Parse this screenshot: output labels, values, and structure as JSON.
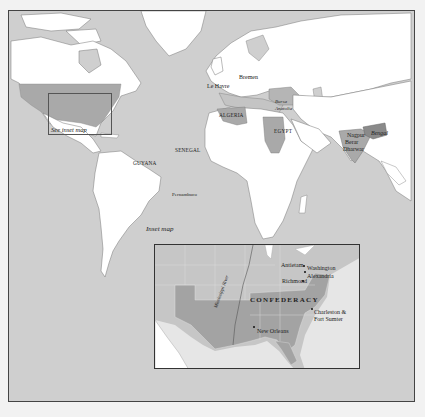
{
  "map": {
    "colors": {
      "ocean": "#cfcfcf",
      "land": "#ffffff",
      "shaded_region": "#a9a9a9",
      "dark_region": "#8a8a8a",
      "frame": "#444444",
      "page": "#f2f2f2"
    },
    "main_labels": [
      {
        "id": "le-havre",
        "text": "Le Havre"
      },
      {
        "id": "bremen",
        "text": "Bremen"
      },
      {
        "id": "bursa",
        "text": "Bursa"
      },
      {
        "id": "anatolia",
        "text": "Anatolia"
      },
      {
        "id": "algeria",
        "text": "ALGERIA"
      },
      {
        "id": "egypt",
        "text": "EGYPT"
      },
      {
        "id": "senegal",
        "text": "SENEGAL"
      },
      {
        "id": "guyana",
        "text": "GUYANA"
      },
      {
        "id": "pernambuco",
        "text": "Pernambuco"
      },
      {
        "id": "nagpur",
        "text": "Nagpur"
      },
      {
        "id": "berar",
        "text": "Berar"
      },
      {
        "id": "dharwar",
        "text": "Dharwar"
      },
      {
        "id": "bengal",
        "text": "Bengal"
      }
    ],
    "see_inset_label": "See inset map",
    "inset": {
      "caption": "Inset map",
      "region_label": "CONFEDERACY",
      "river_label": "Mississippi River",
      "labels": [
        {
          "id": "antietam",
          "text": "Antietam"
        },
        {
          "id": "washington",
          "text": "Washington"
        },
        {
          "id": "alexandria",
          "text": "Alexandria"
        },
        {
          "id": "richmond",
          "text": "Richmond"
        },
        {
          "id": "charleston-1",
          "text": "Charleston &"
        },
        {
          "id": "charleston-2",
          "text": "Fort Sumter"
        },
        {
          "id": "new-orleans",
          "text": "New Orleans"
        }
      ]
    }
  }
}
